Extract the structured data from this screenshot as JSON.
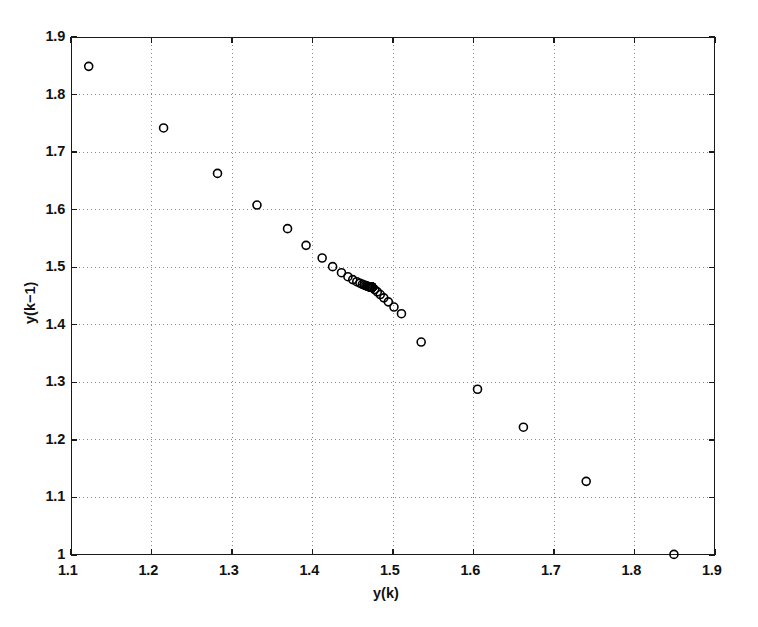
{
  "figure": {
    "background": "#ffffff",
    "axes_color": "#1a1a1a",
    "grid_color": "#8a8a8a",
    "marker_color": "#000000"
  },
  "chart_data": {
    "type": "scatter",
    "title": "",
    "xlabel": "y(k)",
    "ylabel": "y(k-1)",
    "xlim": [
      1.1,
      1.9
    ],
    "ylim": [
      1.0,
      1.9
    ],
    "xticks": [
      1.1,
      1.2,
      1.3,
      1.4,
      1.5,
      1.6,
      1.7,
      1.8,
      1.9
    ],
    "yticks": [
      1.0,
      1.1,
      1.2,
      1.3,
      1.4,
      1.5,
      1.6,
      1.7,
      1.8,
      1.9
    ],
    "xticklabels": [
      "1.1",
      "1.2",
      "1.3",
      "1.4",
      "1.5",
      "1.6",
      "1.7",
      "1.8",
      "1.9"
    ],
    "yticklabels": [
      "1",
      "1.1",
      "1.2",
      "1.3",
      "1.4",
      "1.5",
      "1.6",
      "1.7",
      "1.8",
      "1.9"
    ],
    "grid": true,
    "grid_style": "dotted",
    "legend": null,
    "marker": "o",
    "marker_filled": false,
    "marker_size": 8,
    "series": [
      {
        "name": "trajectory",
        "x": [
          1.122,
          1.215,
          1.282,
          1.331,
          1.369,
          1.392,
          1.412,
          1.425,
          1.436,
          1.444,
          1.45,
          1.455,
          1.459,
          1.462,
          1.4645,
          1.4663,
          1.4678,
          1.469,
          1.4699,
          1.4707,
          1.4713,
          1.4718,
          1.4722,
          1.4725,
          1.4728,
          1.473,
          1.4732,
          1.4733,
          1.4734,
          1.4735,
          1.4736,
          1.47365,
          1.4737,
          1.47375,
          1.4738,
          1.47383,
          1.47386,
          1.47388,
          1.4739,
          1.47392,
          1.47393,
          1.47394,
          1.47395,
          1.47396,
          1.473965,
          1.47397,
          1.473975,
          1.47398,
          1.473985,
          1.47399,
          1.473992,
          1.473994,
          1.473996,
          1.473998,
          1.474,
          1.4772,
          1.4805,
          1.4842,
          1.4886,
          1.4942,
          1.5012,
          1.5105,
          1.535,
          1.605,
          1.662,
          1.74,
          1.849
        ],
        "y": [
          1.849,
          1.742,
          1.663,
          1.608,
          1.567,
          1.538,
          1.516,
          1.501,
          1.4905,
          1.4835,
          1.4785,
          1.4748,
          1.4722,
          1.4703,
          1.4689,
          1.4679,
          1.4672,
          1.4666,
          1.4662,
          1.4659,
          1.46565,
          1.4655,
          1.46537,
          1.46528,
          1.46521,
          1.46516,
          1.46512,
          1.46509,
          1.46507,
          1.46505,
          1.46504,
          1.46503,
          1.465025,
          1.46502,
          1.465015,
          1.46501,
          1.465008,
          1.465006,
          1.465004,
          1.465002,
          1.465001,
          1.465,
          1.464999,
          1.464998,
          1.464997,
          1.464996,
          1.464995,
          1.464994,
          1.464993,
          1.464992,
          1.464991,
          1.46499,
          1.464989,
          1.464988,
          1.464987,
          1.4612,
          1.4572,
          1.4525,
          1.4468,
          1.4398,
          1.4308,
          1.4192,
          1.37,
          1.288,
          1.222,
          1.128,
          1.001
        ]
      }
    ]
  }
}
